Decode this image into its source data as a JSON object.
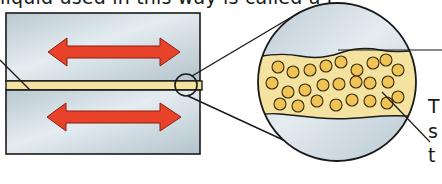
{
  "figure": {
    "type": "lubrication-diagram",
    "caption_top_partial": "liquid used in this way is called a l",
    "side_labels": [
      "T",
      "s",
      "t"
    ],
    "parts": {
      "upper_block": {
        "label": "metal surface (upper)",
        "color": "#c9d6de"
      },
      "lower_block": {
        "label": "metal surface (lower)",
        "color": "#c9d6de"
      },
      "lubricant_layer": {
        "label": "lubricant film",
        "color": "#f3e2a0"
      },
      "upper_arrow": {
        "direction": "double-headed horizontal",
        "color": "#e8432a"
      },
      "lower_arrow": {
        "direction": "double-headed horizontal",
        "color": "#e8432a"
      },
      "magnifier_small_circle": {
        "label": "zoom region"
      },
      "magnified_view": {
        "label": "enlarged lubricant with particles",
        "particle_color": "#f0c454"
      }
    },
    "colors": {
      "outline": "#1a1a1a",
      "metal": "#c9d6de",
      "metal_highlight": "#e6eef2",
      "lubricant": "#f3e2a0",
      "particle": "#f0c454",
      "arrow": "#e8432a"
    }
  }
}
